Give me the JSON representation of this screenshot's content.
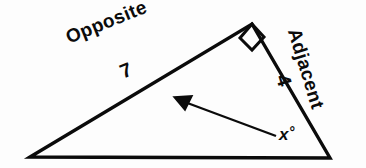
{
  "figure": {
    "kind": "right-triangle-trigonometry-diagram",
    "background_color": "#fdfdfd",
    "stroke_color": "#0b0b0b",
    "labels": {
      "opposite_side": "Opposite",
      "opposite_length": "7",
      "adjacent_side": "Adjacent",
      "adjacent_length": "4",
      "angle_variable": "x",
      "angle_degree_symbol": "°"
    },
    "markers": {
      "right_angle": "right-angle-square",
      "pointer": "arrow"
    },
    "geometry": {
      "vertex_left": [
        30,
        157
      ],
      "vertex_apex": [
        252,
        24
      ],
      "vertex_right": [
        330,
        158
      ],
      "arrow_tail": [
        276,
        136
      ],
      "arrow_tip": [
        176,
        98
      ]
    }
  }
}
